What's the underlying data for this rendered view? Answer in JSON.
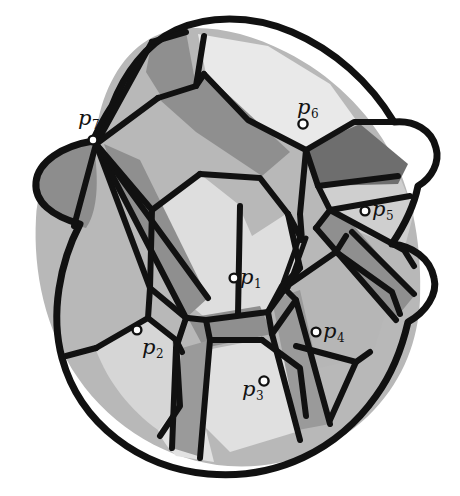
{
  "figure": {
    "background_color": "#ffffff",
    "stroke_color": "#111111"
  },
  "palette": {
    "very_light_gray": "#e9e9e9",
    "light_gray": "#d8d8d8",
    "mid_light_gray": "#c0c0c0",
    "mid_gray": "#a9a9a9",
    "gray": "#969696",
    "dark_gray": "#7d7d7d",
    "darker_gray": "#6e6e6e"
  },
  "sites": [
    {
      "id": "p1",
      "label": "p",
      "subscript": "1",
      "label_left": 240,
      "label_top": 267,
      "dot_x": 234,
      "dot_y": 278,
      "dot_r": 4.4
    },
    {
      "id": "p2",
      "label": "p",
      "subscript": "2",
      "label_left": 142,
      "label_top": 337,
      "dot_x": 137,
      "dot_y": 330,
      "dot_r": 4.4
    },
    {
      "id": "p3",
      "label": "p",
      "subscript": "3",
      "label_left": 242,
      "label_top": 379,
      "dot_x": 264,
      "dot_y": 381,
      "dot_r": 4.6
    },
    {
      "id": "p4",
      "label": "p",
      "subscript": "4",
      "label_left": 323,
      "label_top": 321,
      "dot_x": 316,
      "dot_y": 332,
      "dot_r": 4.4
    },
    {
      "id": "p5",
      "label": "p",
      "subscript": "5",
      "label_left": 372,
      "label_top": 199,
      "dot_x": 365,
      "dot_y": 211,
      "dot_r": 4.4
    },
    {
      "id": "p6",
      "label": "p",
      "subscript": "6",
      "label_left": 297,
      "label_top": 97,
      "dot_x": 303,
      "dot_y": 124,
      "dot_r": 4.6
    },
    {
      "id": "p7",
      "label": "p",
      "subscript": "7",
      "label_left": 78,
      "label_top": 108,
      "dot_x": 93,
      "dot_y": 140,
      "dot_r": 4.4
    }
  ],
  "regions": [
    {
      "id": "region-outer-left-disk",
      "fill": "#b8b8b8"
    },
    {
      "id": "region-lower-left-light",
      "fill": "#d8d8d8"
    },
    {
      "id": "region-bottom-light",
      "fill": "#e0e0e0"
    },
    {
      "id": "region-p7-lens",
      "fill": "#8d8d8d"
    },
    {
      "id": "region-top-cap-light",
      "fill": "#e9e9e9"
    },
    {
      "id": "region-top-left-dark",
      "fill": "#8f8f8f"
    },
    {
      "id": "region-central-light",
      "fill": "#dedede"
    },
    {
      "id": "region-central-band",
      "fill": "#8f8f8f"
    },
    {
      "id": "region-right-dark-wedge",
      "fill": "#6e6e6e"
    },
    {
      "id": "region-right-light-wedge",
      "fill": "#cfcfcf"
    },
    {
      "id": "region-p4-cell",
      "fill": "#b4b4b4"
    },
    {
      "id": "region-p3-cell",
      "fill": "#e0e0e0"
    },
    {
      "id": "region-diagonal-bar",
      "fill": "#8f8f8f"
    }
  ],
  "counts": {
    "num_sites": 7,
    "num_cells": 13
  }
}
